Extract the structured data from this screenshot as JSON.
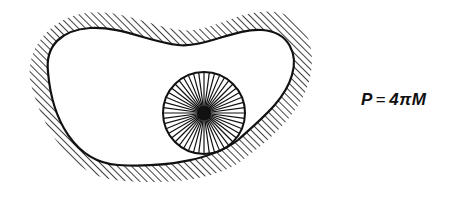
{
  "figure": {
    "type": "physics-diagram",
    "colors": {
      "line": "#111111",
      "background": "#ffffff"
    },
    "cavity": {
      "boundary": "closed-curve",
      "hatching": "diagonal-lines-outside"
    },
    "sphere": {
      "center": [
        204,
        113
      ],
      "radius": 41,
      "spoke_count": 48,
      "style": "radial-lines-dense-center"
    }
  },
  "equation": {
    "lhs": "P",
    "operator": "=",
    "rhs": "4πM"
  }
}
